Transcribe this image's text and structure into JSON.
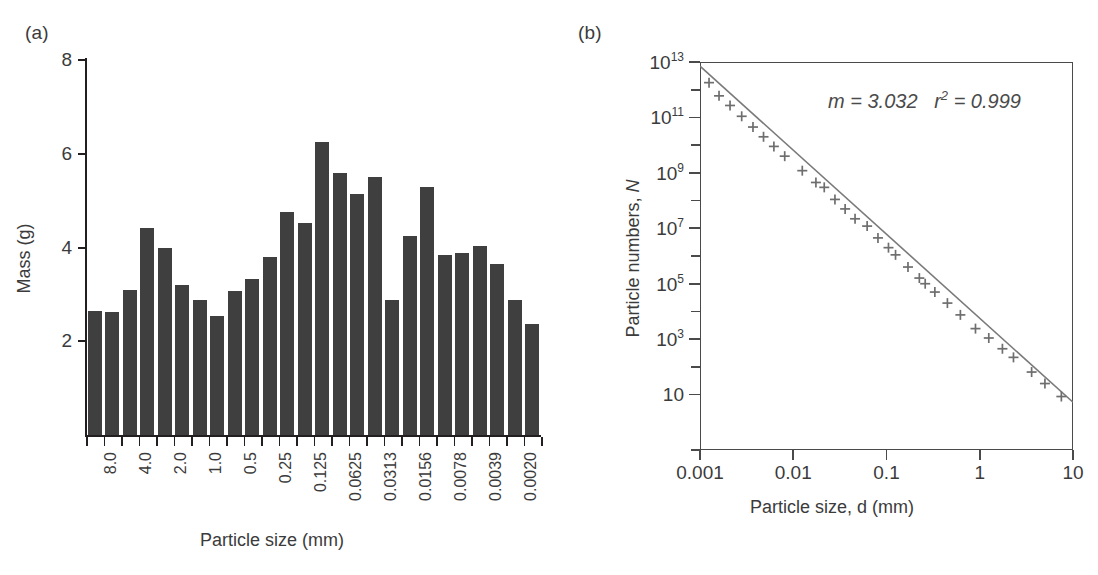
{
  "figure": {
    "panel_a_letter": "(a)",
    "panel_b_letter": "(b)"
  },
  "chart_data": [
    {
      "type": "bar",
      "panel": "(a)",
      "title": "",
      "xlabel": "Particle size (mm)",
      "ylabel": "Mass (g)",
      "ylim": [
        0,
        8
      ],
      "ytick_labels": [
        "8",
        "6",
        "4",
        "2"
      ],
      "ytick_values": [
        8,
        6,
        4,
        2
      ],
      "grid": false,
      "bar_color": "#3f3f3f",
      "categories": [
        "8.0",
        "",
        "4.0",
        "",
        "2.0",
        "",
        "1.0",
        "",
        "0.5",
        "",
        "0.25",
        "",
        "0.125",
        "",
        "0.0625",
        "",
        "0.0313",
        "",
        "0.0156",
        "",
        "0.0078",
        "",
        "0.0039",
        "",
        "0.0020",
        ""
      ],
      "tick_labels": [
        "8.0",
        "4.0",
        "2.0",
        "1.0",
        "0.5",
        "0.25",
        "0.125",
        "0.0625",
        "0.0313",
        "0.0156",
        "0.0078",
        "0.0039",
        "0.0020"
      ],
      "values": [
        2.65,
        2.63,
        3.1,
        4.42,
        3.98,
        3.21,
        2.88,
        2.53,
        3.08,
        3.33,
        3.79,
        4.75,
        4.52,
        6.26,
        5.6,
        5.15,
        5.5,
        2.87,
        4.25,
        5.3,
        3.83,
        3.88,
        4.03,
        3.64,
        2.89,
        2.36
      ]
    },
    {
      "type": "scatter",
      "panel": "(b)",
      "title": "",
      "xlabel": "Particle size, d (mm)",
      "ylabel": "Particle numbers, N",
      "xscale": "log",
      "yscale": "log",
      "xlim": [
        0.001,
        10
      ],
      "ylim": [
        0.1,
        10000000000000
      ],
      "xtick_labels": [
        "0.001",
        "0.01",
        "0.1",
        "1",
        "10"
      ],
      "xtick_values": [
        0.001,
        0.01,
        0.1,
        1,
        10
      ],
      "ytick_labels": [
        "10",
        "10^3",
        "10^5",
        "10^7",
        "10^9",
        "10^11",
        "10^13"
      ],
      "ytick_mantissas": [
        "10",
        "10",
        "10",
        "10",
        "10",
        "10",
        "10"
      ],
      "ytick_exponents": [
        "",
        "3",
        "5",
        "7",
        "9",
        "11",
        "13"
      ],
      "ytick_values": [
        10,
        1000,
        100000,
        10000000,
        1000000000,
        100000000000,
        10000000000000
      ],
      "grid": false,
      "marker": "plus",
      "marker_color": "#6e6e6e",
      "line_color": "#7a7a7a",
      "annotation": "m = 3.032   r² = 0.999",
      "annotation_parts": {
        "slope_symbol": "m",
        "slope_value": "3.032",
        "r2_symbol": "r",
        "r2_exponent": "2",
        "r2_value": "0.999"
      },
      "fit": {
        "slope": -3.032,
        "intercept_log10_at_d_0p001": 12.85
      },
      "points": [
        {
          "x": 0.00125,
          "y": 1800000000000.0
        },
        {
          "x": 0.0016,
          "y": 600000000000.0
        },
        {
          "x": 0.0021,
          "y": 270000000000.0
        },
        {
          "x": 0.0028,
          "y": 110000000000.0
        },
        {
          "x": 0.0037,
          "y": 45000000000.0
        },
        {
          "x": 0.0048,
          "y": 20000000000.0
        },
        {
          "x": 0.0062,
          "y": 9000000000.0
        },
        {
          "x": 0.0081,
          "y": 4000000000.0
        },
        {
          "x": 0.0125,
          "y": 1200000000.0
        },
        {
          "x": 0.0175,
          "y": 450000000.0
        },
        {
          "x": 0.0215,
          "y": 300000000.0
        },
        {
          "x": 0.028,
          "y": 110000000.0
        },
        {
          "x": 0.036,
          "y": 50000000.0
        },
        {
          "x": 0.046,
          "y": 22000000.0
        },
        {
          "x": 0.062,
          "y": 12000000.0
        },
        {
          "x": 0.081,
          "y": 4500000.0
        },
        {
          "x": 0.105,
          "y": 2000000.0
        },
        {
          "x": 0.125,
          "y": 1100000.0
        },
        {
          "x": 0.17,
          "y": 400000.0
        },
        {
          "x": 0.225,
          "y": 160000.0
        },
        {
          "x": 0.26,
          "y": 100000.0
        },
        {
          "x": 0.33,
          "y": 50000.0
        },
        {
          "x": 0.45,
          "y": 20000.0
        },
        {
          "x": 0.62,
          "y": 7500.0
        },
        {
          "x": 0.9,
          "y": 2400.0
        },
        {
          "x": 1.25,
          "y": 1100.0
        },
        {
          "x": 1.75,
          "y": 450.0
        },
        {
          "x": 2.3,
          "y": 220.0
        },
        {
          "x": 3.6,
          "y": 65
        },
        {
          "x": 5.0,
          "y": 25
        },
        {
          "x": 7.5,
          "y": 8.5
        }
      ]
    }
  ]
}
